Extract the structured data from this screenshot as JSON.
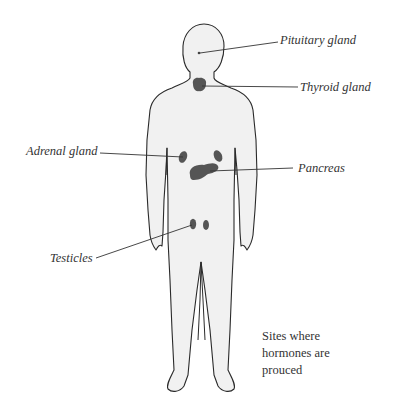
{
  "diagram": {
    "title": "Sites where hormones are prouced",
    "caption_lines": [
      "Sites where",
      "hormones are",
      "prouced"
    ],
    "colors": {
      "body_fill": "#f1f1f1",
      "outline": "#2a2a2a",
      "gland": "#555555",
      "leader": "#333333",
      "text": "#333333"
    },
    "labels": {
      "pituitary": "Pituitary gland",
      "thyroid": "Thyroid gland",
      "adrenal": "Adrenal gland",
      "pancreas": "Pancreas",
      "testicles": "Testicles"
    }
  }
}
